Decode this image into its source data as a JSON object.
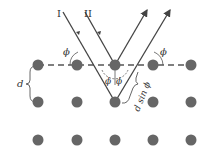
{
  "diagram": {
    "beams": {
      "incident_1_label": "I",
      "incident_2_label": "II"
    },
    "labels": {
      "angle_left": "ϕ",
      "angle_right": "ϕ",
      "angle_center_left": "ϕ",
      "angle_center_right": "ϕ",
      "spacing": "d",
      "path_difference": "d sin ϕ"
    },
    "lattice": {
      "rows": 3,
      "columns": 5,
      "atom_color": "#666666",
      "line_color": "#444444"
    }
  }
}
